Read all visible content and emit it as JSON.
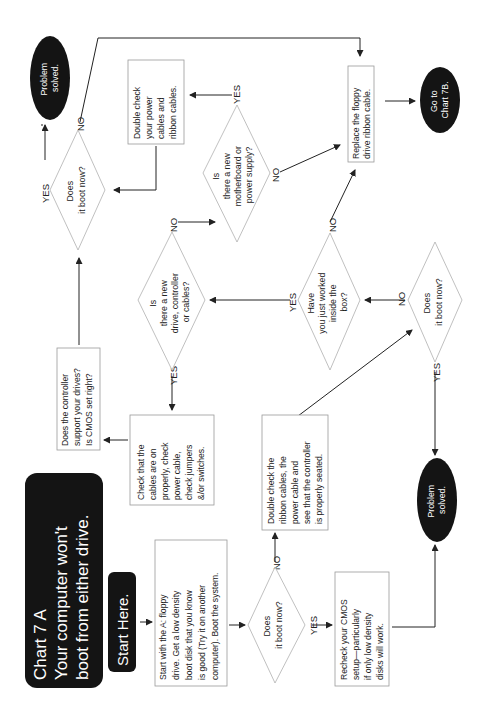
{
  "title": {
    "line1": "Chart 7 A",
    "line2": "Your computer won't",
    "line3": "boot from either drive."
  },
  "start_here": "Start Here.",
  "nodes": {
    "start_box": [
      "Start with the A: floppy",
      "drive. Get a low density",
      "boot disk that you know",
      "is good (Try it on another",
      "computer). Boot the system."
    ],
    "q_boot_1": [
      "Does",
      "it boot now?"
    ],
    "double_check_ribbon": [
      "Double check the",
      "ribbon cables, the",
      "power cable and",
      "see that the controller",
      "is properly seated."
    ],
    "recheck_cmos": [
      "Recheck your CMOS",
      "setup—particularly",
      "if only low density",
      "disks will work."
    ],
    "solved_bottom": [
      "Problem",
      "solved."
    ],
    "q_boot_2": [
      "Does",
      "it boot now?"
    ],
    "q_worked_inside": [
      "Have",
      "you just worked",
      "inside the",
      "box?"
    ],
    "q_new_drive": [
      "Is",
      "there a new",
      "drive, controller",
      "or cables?"
    ],
    "check_cables": [
      "Check that the",
      "cables are on",
      "properly, check",
      "power cable,",
      "check jumpers",
      "&/or switches."
    ],
    "controller_support": [
      "Does the controller",
      "support your drives?",
      "Is CMOS set right?"
    ],
    "q_boot_3": [
      "Does",
      "it boot now?"
    ],
    "solved_top": [
      "Problem",
      "solved."
    ],
    "q_new_motherboard": [
      "Is",
      "there a new",
      "motherboard or",
      "power supply?"
    ],
    "double_check_power": [
      "Double check",
      "your power",
      "cables and",
      "ribbon cables."
    ],
    "replace_floppy": [
      "Replace the floppy",
      "drive ribbon cable."
    ],
    "goto_7b": [
      "Go to",
      "Chart 7B."
    ]
  },
  "edge_labels": {
    "yes": "YES",
    "no": "NO"
  },
  "colors": {
    "terminal_fill": "#141414",
    "terminal_text": "#ffffff",
    "box_border": "#9a9a9a",
    "line": "#222222"
  }
}
